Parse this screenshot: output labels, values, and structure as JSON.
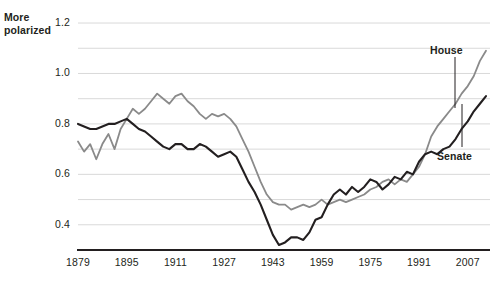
{
  "axis_note": {
    "line1": "More",
    "line2": "polarized"
  },
  "chart_data": {
    "type": "line",
    "title": "",
    "subtitle": "",
    "xlabel": "",
    "ylabel": "",
    "annotations": [
      "More polarized"
    ],
    "grid": true,
    "grid_minor_step": 0.1,
    "legend_position": "inline-labels",
    "xlim": [
      1879,
      2013
    ],
    "ylim": [
      0.3,
      1.22
    ],
    "xticks": [
      1879,
      1895,
      1911,
      1927,
      1943,
      1959,
      1975,
      1991,
      2007
    ],
    "xtick_labels": [
      "1879",
      "1895",
      "1911",
      "1927",
      "1943",
      "1959",
      "1975",
      "1991",
      "2007"
    ],
    "yticks": [
      0.4,
      0.6,
      0.8,
      1.0,
      1.2
    ],
    "ytick_labels": [
      "0.4",
      "0.6",
      "0.8",
      "1.0",
      "1.2"
    ],
    "ygridlines": [
      0.4,
      0.5,
      0.6,
      0.7,
      0.8,
      0.9,
      1.0,
      1.1,
      1.2
    ],
    "colors": {
      "house": "#8a8a8a",
      "senate": "#231f20",
      "grid": "#d9d9d9",
      "axis": "#231f20",
      "background": "#ffffff"
    },
    "x": [
      1879,
      1881,
      1883,
      1885,
      1887,
      1889,
      1891,
      1893,
      1895,
      1897,
      1899,
      1901,
      1903,
      1905,
      1907,
      1909,
      1911,
      1913,
      1915,
      1917,
      1919,
      1921,
      1923,
      1925,
      1927,
      1929,
      1931,
      1933,
      1935,
      1937,
      1939,
      1941,
      1943,
      1945,
      1947,
      1949,
      1951,
      1953,
      1955,
      1957,
      1959,
      1961,
      1963,
      1965,
      1967,
      1969,
      1971,
      1973,
      1975,
      1977,
      1979,
      1981,
      1983,
      1985,
      1987,
      1989,
      1991,
      1993,
      1995,
      1997,
      1999,
      2001,
      2003,
      2005,
      2007,
      2009,
      2011,
      2013
    ],
    "series": [
      {
        "name": "House",
        "label": "House",
        "color": "#8a8a8a",
        "values": [
          0.73,
          0.69,
          0.72,
          0.66,
          0.72,
          0.76,
          0.7,
          0.78,
          0.82,
          0.86,
          0.84,
          0.86,
          0.89,
          0.92,
          0.9,
          0.88,
          0.91,
          0.92,
          0.89,
          0.87,
          0.84,
          0.82,
          0.84,
          0.83,
          0.84,
          0.82,
          0.79,
          0.74,
          0.69,
          0.63,
          0.57,
          0.52,
          0.49,
          0.48,
          0.48,
          0.46,
          0.47,
          0.48,
          0.47,
          0.48,
          0.5,
          0.48,
          0.49,
          0.5,
          0.49,
          0.5,
          0.51,
          0.52,
          0.54,
          0.55,
          0.57,
          0.58,
          0.56,
          0.58,
          0.57,
          0.6,
          0.63,
          0.68,
          0.75,
          0.79,
          0.82,
          0.85,
          0.88,
          0.92,
          0.95,
          0.99,
          1.05,
          1.09
        ]
      },
      {
        "name": "Senate",
        "label": "Senate",
        "color": "#231f20",
        "values": [
          0.8,
          0.79,
          0.78,
          0.78,
          0.79,
          0.8,
          0.8,
          0.81,
          0.82,
          0.8,
          0.78,
          0.77,
          0.75,
          0.73,
          0.71,
          0.7,
          0.72,
          0.72,
          0.7,
          0.7,
          0.72,
          0.71,
          0.69,
          0.67,
          0.68,
          0.69,
          0.67,
          0.62,
          0.57,
          0.53,
          0.48,
          0.42,
          0.36,
          0.32,
          0.33,
          0.35,
          0.35,
          0.34,
          0.37,
          0.42,
          0.43,
          0.48,
          0.52,
          0.54,
          0.52,
          0.55,
          0.53,
          0.55,
          0.58,
          0.57,
          0.54,
          0.56,
          0.59,
          0.58,
          0.61,
          0.6,
          0.65,
          0.68,
          0.69,
          0.68,
          0.7,
          0.71,
          0.74,
          0.78,
          0.81,
          0.85,
          0.88,
          0.91
        ]
      }
    ]
  }
}
